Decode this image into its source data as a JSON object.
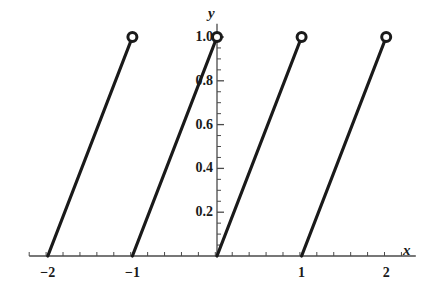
{
  "chart_data": {
    "type": "line",
    "title": "",
    "subtitle": "",
    "xlabel": "x",
    "ylabel": "y",
    "xlim": [
      -2.22,
      2.35
    ],
    "ylim": [
      0,
      1.06
    ],
    "grid": false,
    "legend": null,
    "x_ticks": [
      {
        "value": -2,
        "label": "-2"
      },
      {
        "value": -1,
        "label": "-1"
      },
      {
        "value": 0,
        "label": ""
      },
      {
        "value": 1,
        "label": "1"
      },
      {
        "value": 2,
        "label": "2"
      }
    ],
    "y_ticks": [
      {
        "value": 0.2,
        "label": "0.2"
      },
      {
        "value": 0.4,
        "label": "0.4"
      },
      {
        "value": 0.6,
        "label": "0.6"
      },
      {
        "value": 0.8,
        "label": "0.8"
      },
      {
        "value": 1.0,
        "label": "1.0"
      }
    ],
    "x_minor_tick_step": 0.2,
    "y_minor_tick_step": 0.05,
    "series": [
      {
        "name": "sawtooth",
        "description": "fractional part function, period 1",
        "segments": [
          {
            "x0": -2,
            "y0": 0,
            "x1": -1,
            "y1": 1
          },
          {
            "x0": -1,
            "y0": 0,
            "x1": 0,
            "y1": 1
          },
          {
            "x0": 0,
            "y0": 0,
            "x1": 1,
            "y1": 1
          },
          {
            "x0": 1,
            "y0": 0,
            "x1": 2,
            "y1": 1
          }
        ],
        "open_markers": [
          {
            "x": -1,
            "y": 1
          },
          {
            "x": 0,
            "y": 1
          },
          {
            "x": 1,
            "y": 1
          },
          {
            "x": 2,
            "y": 1
          }
        ],
        "color": "#1a1a1a",
        "line_width": 3.2,
        "marker": "open-circle",
        "marker_size": 9
      }
    ],
    "axis_color": "#4a4a4a",
    "background": "#ffffff"
  },
  "labels": {
    "x_axis": "x",
    "y_axis": "y"
  }
}
